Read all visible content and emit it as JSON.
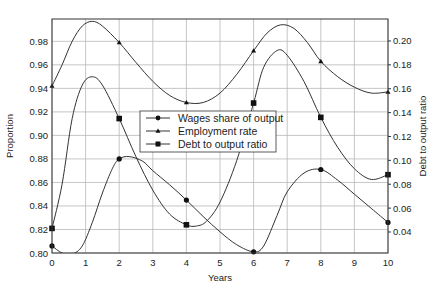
{
  "chart_data": {
    "type": "line",
    "title": "",
    "xlabel": "Years",
    "ylabel": "Proportion",
    "y2label": "Debt to output ratio",
    "xlim": [
      0,
      10
    ],
    "ylim": [
      0.8,
      0.999
    ],
    "y2lim": [
      0.0224,
      0.2184
    ],
    "x_ticks": [
      0,
      1,
      2,
      3,
      4,
      5,
      6,
      7,
      8,
      9,
      10
    ],
    "x_tick_labels": [
      "0",
      "1",
      "2",
      "3",
      "4",
      "5",
      "6",
      "7",
      "8",
      "9",
      "10"
    ],
    "y_ticks": [
      0.8,
      0.82,
      0.84,
      0.86,
      0.88,
      0.9,
      0.92,
      0.94,
      0.96,
      0.98
    ],
    "y_tick_labels": [
      "0.80",
      "0.82",
      "0.84",
      "0.86",
      "0.88",
      "0.90",
      "0.92",
      "0.94",
      "0.96",
      "0.98"
    ],
    "y2_ticks": [
      0.04,
      0.06,
      0.08,
      0.1,
      0.12,
      0.14,
      0.16,
      0.18,
      0.2
    ],
    "y2_tick_labels": [
      "0.04",
      "0.06",
      "0.08",
      "0.10",
      "0.12",
      "0.14",
      "0.16",
      "0.18",
      "0.20"
    ],
    "grid": true,
    "legend_position": "center-left inside plot",
    "series": [
      {
        "name": "Wages share of output",
        "axis": "left",
        "marker": "circle",
        "marker_x": [
          0,
          2,
          4,
          6,
          8,
          10
        ],
        "marker_y": [
          0.806,
          0.88,
          0.845,
          0.801,
          0.871,
          0.826
        ],
        "curve_x": [
          0,
          0.3,
          0.6,
          0.9,
          1.2,
          1.5,
          1.8,
          2.0,
          2.3,
          2.7,
          3.0,
          3.5,
          4.0,
          4.5,
          5.0,
          5.5,
          6.0,
          6.3,
          6.7,
          7.0,
          7.5,
          8.0,
          8.5,
          9.0,
          9.5,
          10.0
        ],
        "curve_y": [
          0.806,
          0.8,
          0.799,
          0.806,
          0.826,
          0.851,
          0.872,
          0.88,
          0.882,
          0.878,
          0.87,
          0.858,
          0.845,
          0.831,
          0.818,
          0.807,
          0.801,
          0.806,
          0.832,
          0.852,
          0.868,
          0.871,
          0.862,
          0.85,
          0.838,
          0.826
        ]
      },
      {
        "name": "Employment rate",
        "axis": "left",
        "marker": "triangle",
        "marker_x": [
          0,
          2,
          4,
          6,
          8,
          10
        ],
        "marker_y": [
          0.942,
          0.979,
          0.928,
          0.972,
          0.963,
          0.937
        ],
        "curve_x": [
          0,
          0.3,
          0.6,
          0.9,
          1.2,
          1.5,
          2.0,
          2.5,
          3.0,
          3.5,
          4.0,
          4.5,
          5.0,
          5.5,
          6.0,
          6.4,
          6.8,
          7.2,
          7.6,
          8.0,
          8.5,
          9.0,
          9.5,
          10.0
        ],
        "curve_y": [
          0.942,
          0.96,
          0.98,
          0.993,
          0.997,
          0.993,
          0.979,
          0.962,
          0.946,
          0.934,
          0.928,
          0.928,
          0.936,
          0.952,
          0.972,
          0.987,
          0.994,
          0.991,
          0.979,
          0.963,
          0.95,
          0.941,
          0.936,
          0.937
        ]
      },
      {
        "name": "Debt to output ratio",
        "axis": "right",
        "marker": "square",
        "marker_x": [
          0,
          2,
          4,
          6,
          8,
          10
        ],
        "marker_y": [
          0.043,
          0.135,
          0.046,
          0.148,
          0.136,
          0.088
        ],
        "curve_x": [
          0,
          0.3,
          0.6,
          0.9,
          1.2,
          1.5,
          2.0,
          2.5,
          3.0,
          3.5,
          4.0,
          4.3,
          4.6,
          5.0,
          5.5,
          6.0,
          6.3,
          6.7,
          7.0,
          7.5,
          8.0,
          8.5,
          9.0,
          9.5,
          10.0
        ],
        "curve_y": [
          0.043,
          0.08,
          0.135,
          0.163,
          0.17,
          0.163,
          0.135,
          0.103,
          0.075,
          0.055,
          0.046,
          0.045,
          0.049,
          0.065,
          0.1,
          0.148,
          0.178,
          0.192,
          0.188,
          0.166,
          0.136,
          0.111,
          0.093,
          0.084,
          0.088
        ]
      }
    ]
  },
  "legend": {
    "items": [
      {
        "label": "Wages share of output",
        "marker": "circle"
      },
      {
        "label": "Employment rate",
        "marker": "triangle"
      },
      {
        "label": "Debt to output ratio",
        "marker": "square"
      }
    ]
  },
  "axes": {
    "xlabel": "Years",
    "ylabel": "Proportion",
    "y2label": "Debt to output ratio"
  },
  "colors": {
    "line": "#333333",
    "grid": "#b8b8b8",
    "background": "#ffffff"
  }
}
